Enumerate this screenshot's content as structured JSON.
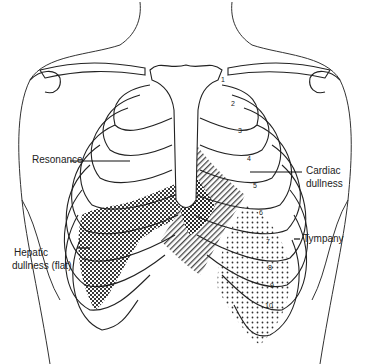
{
  "labels": {
    "resonance": "Resonance",
    "cardiac_line1": "Cardiac",
    "cardiac_line2": "dullness",
    "tympany": "Tympany",
    "hepatic_line1": "Hepatic",
    "hepatic_line2": "dullness (flat)"
  },
  "rib_numbers": [
    "1",
    "2",
    "3",
    "4",
    "5",
    "6",
    "7",
    "8",
    "9",
    "10"
  ],
  "colors": {
    "ink": "#222222",
    "background": "#ffffff"
  }
}
